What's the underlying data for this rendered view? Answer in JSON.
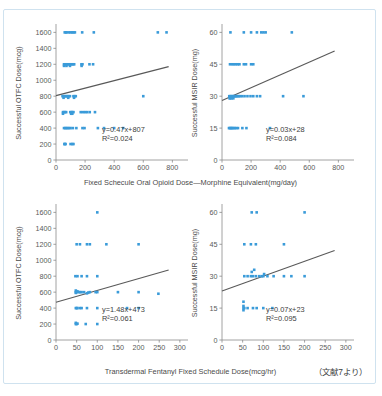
{
  "header": {
    "cropped_title_fragment": ""
  },
  "figure": {
    "source_note": "（文献7より）",
    "shared_xlabel_top": "Fixed Schecule Oral Opioid Dose—Morphine Equivalent(mg/day)",
    "shared_xlabel_bottom": "Transdermal Fentanyl Fixed Schedule Dose(mcg/hr)",
    "marker_color": "#3a9bd9",
    "trendline_color": "#595959",
    "axis_color": "#8a8a8a",
    "border_color": "#cfe2ef"
  },
  "chart_data": [
    {
      "id": "top-left",
      "type": "scatter",
      "title": "",
      "xlabel": "Fixed Schecule Oral Opioid Dose—Morphine Equivalent(mg/day)",
      "ylabel": "Successful OTFC Dose(mcg)",
      "xlim": [
        0,
        880
      ],
      "ylim": [
        0,
        1680
      ],
      "xticks": [
        0,
        200,
        400,
        600,
        800
      ],
      "yticks": [
        0,
        200,
        400,
        600,
        800,
        1000,
        1200,
        1400,
        1600
      ],
      "grid": false,
      "legend": "none",
      "fit_label": "y=0.47x+807",
      "r2_label": "R²=0.024",
      "fit_slope": 0.47,
      "fit_intercept": 807,
      "r2": 0.024,
      "points": [
        [
          60,
          1600
        ],
        [
          68,
          1600
        ],
        [
          75,
          1600
        ],
        [
          90,
          1600
        ],
        [
          100,
          1600
        ],
        [
          112,
          1600
        ],
        [
          120,
          1600
        ],
        [
          130,
          1600
        ],
        [
          180,
          1600
        ],
        [
          260,
          1600
        ],
        [
          700,
          1600
        ],
        [
          760,
          1600
        ],
        [
          55,
          1200
        ],
        [
          62,
          1200
        ],
        [
          70,
          1200
        ],
        [
          78,
          1200
        ],
        [
          86,
          1200
        ],
        [
          95,
          1200
        ],
        [
          100,
          1200
        ],
        [
          108,
          1200
        ],
        [
          118,
          1200
        ],
        [
          125,
          1200
        ],
        [
          175,
          1200
        ],
        [
          182,
          1200
        ],
        [
          230,
          1200
        ],
        [
          255,
          1200
        ],
        [
          55,
          1180
        ],
        [
          72,
          1180
        ],
        [
          96,
          1180
        ],
        [
          176,
          1180
        ],
        [
          45,
          800
        ],
        [
          52,
          800
        ],
        [
          60,
          800
        ],
        [
          66,
          800
        ],
        [
          74,
          800
        ],
        [
          80,
          800
        ],
        [
          88,
          800
        ],
        [
          96,
          800
        ],
        [
          120,
          800
        ],
        [
          128,
          800
        ],
        [
          136,
          800
        ],
        [
          600,
          800
        ],
        [
          52,
          780
        ],
        [
          84,
          780
        ],
        [
          124,
          780
        ],
        [
          48,
          600
        ],
        [
          55,
          600
        ],
        [
          62,
          600
        ],
        [
          70,
          600
        ],
        [
          98,
          600
        ],
        [
          106,
          600
        ],
        [
          112,
          600
        ],
        [
          120,
          600
        ],
        [
          170,
          600
        ],
        [
          186,
          600
        ],
        [
          200,
          600
        ],
        [
          214,
          600
        ],
        [
          232,
          600
        ],
        [
          268,
          600
        ],
        [
          48,
          580
        ],
        [
          104,
          580
        ],
        [
          112,
          580
        ],
        [
          55,
          400
        ],
        [
          64,
          400
        ],
        [
          72,
          400
        ],
        [
          80,
          400
        ],
        [
          90,
          400
        ],
        [
          100,
          400
        ],
        [
          116,
          400
        ],
        [
          140,
          400
        ],
        [
          182,
          400
        ],
        [
          196,
          400
        ],
        [
          288,
          400
        ],
        [
          330,
          400
        ],
        [
          400,
          400
        ],
        [
          462,
          400
        ],
        [
          58,
          200
        ],
        [
          60,
          200
        ],
        [
          66,
          200
        ],
        [
          100,
          200
        ],
        [
          112,
          200
        ],
        [
          120,
          200
        ]
      ]
    },
    {
      "id": "top-right",
      "type": "scatter",
      "title": "",
      "xlabel": "Fixed Schecule Oral Opioid Dose—Morphine Equivalent(mg/day)",
      "ylabel": "Successful MSIR Dose(mg)",
      "xlim": [
        0,
        880
      ],
      "ylim": [
        0,
        63
      ],
      "xticks": [
        0,
        200,
        400,
        600,
        800
      ],
      "yticks": [
        0,
        15,
        30,
        45,
        60
      ],
      "grid": false,
      "legend": "none",
      "fit_label": "y=0.03x+28",
      "r2_label": "R²=0.084",
      "fit_slope": 0.03,
      "fit_intercept": 28,
      "r2": 0.084,
      "points": [
        [
          58,
          60
        ],
        [
          150,
          60
        ],
        [
          200,
          60
        ],
        [
          240,
          60
        ],
        [
          270,
          60
        ],
        [
          285,
          60
        ],
        [
          300,
          60
        ],
        [
          480,
          60
        ],
        [
          55,
          45
        ],
        [
          70,
          45
        ],
        [
          82,
          45
        ],
        [
          95,
          45
        ],
        [
          108,
          45
        ],
        [
          120,
          45
        ],
        [
          150,
          45
        ],
        [
          165,
          45
        ],
        [
          200,
          45
        ],
        [
          215,
          45
        ],
        [
          50,
          30
        ],
        [
          56,
          30
        ],
        [
          62,
          30
        ],
        [
          68,
          30
        ],
        [
          74,
          30
        ],
        [
          80,
          30
        ],
        [
          86,
          30
        ],
        [
          92,
          30
        ],
        [
          98,
          30
        ],
        [
          106,
          30
        ],
        [
          114,
          30
        ],
        [
          124,
          30
        ],
        [
          138,
          30
        ],
        [
          155,
          30
        ],
        [
          175,
          30
        ],
        [
          196,
          30
        ],
        [
          215,
          30
        ],
        [
          240,
          30
        ],
        [
          262,
          30
        ],
        [
          420,
          30
        ],
        [
          560,
          30
        ],
        [
          52,
          29
        ],
        [
          58,
          29
        ],
        [
          66,
          29
        ],
        [
          78,
          29
        ],
        [
          48,
          15
        ],
        [
          54,
          15
        ],
        [
          60,
          15
        ],
        [
          66,
          15
        ],
        [
          72,
          15
        ],
        [
          80,
          15
        ],
        [
          88,
          15
        ],
        [
          98,
          15
        ],
        [
          110,
          15
        ],
        [
          140,
          15
        ],
        [
          168,
          15
        ],
        [
          330,
          15
        ]
      ]
    },
    {
      "id": "bottom-left",
      "type": "scatter",
      "title": "",
      "xlabel": "Transdermal Fentanyl Fixed Schedule Dose(mcg/hr)",
      "ylabel": "Successful OTFC Dose(mcg)",
      "xlim": [
        0,
        310
      ],
      "ylim": [
        0,
        1680
      ],
      "xticks": [
        0,
        50,
        100,
        150,
        200,
        250,
        300
      ],
      "yticks": [
        0,
        200,
        400,
        600,
        800,
        1000,
        1200,
        1400,
        1600
      ],
      "grid": false,
      "legend": "none",
      "fit_label": "y=1.48x+473",
      "r2_label": "R²=0.061",
      "fit_slope": 1.48,
      "fit_intercept": 473,
      "r2": 0.061,
      "points": [
        [
          100,
          1600
        ],
        [
          50,
          1200
        ],
        [
          58,
          1200
        ],
        [
          75,
          1200
        ],
        [
          82,
          1200
        ],
        [
          122,
          1200
        ],
        [
          200,
          1200
        ],
        [
          47,
          800
        ],
        [
          52,
          800
        ],
        [
          62,
          800
        ],
        [
          75,
          800
        ],
        [
          100,
          800
        ],
        [
          48,
          620
        ],
        [
          48,
          600
        ],
        [
          48,
          590
        ],
        [
          50,
          600
        ],
        [
          52,
          610
        ],
        [
          55,
          600
        ],
        [
          58,
          600
        ],
        [
          62,
          600
        ],
        [
          68,
          600
        ],
        [
          75,
          585
        ],
        [
          78,
          595
        ],
        [
          82,
          600
        ],
        [
          96,
          600
        ],
        [
          100,
          600
        ],
        [
          150,
          600
        ],
        [
          200,
          600
        ],
        [
          248,
          580
        ],
        [
          48,
          400
        ],
        [
          50,
          400
        ],
        [
          52,
          400
        ],
        [
          58,
          400
        ],
        [
          62,
          400
        ],
        [
          75,
          400
        ],
        [
          100,
          400
        ],
        [
          172,
          400
        ],
        [
          200,
          400
        ],
        [
          48,
          200
        ],
        [
          48,
          215
        ],
        [
          50,
          200
        ],
        [
          52,
          205
        ],
        [
          72,
          200
        ],
        [
          100,
          200
        ]
      ]
    },
    {
      "id": "bottom-right",
      "type": "scatter",
      "title": "",
      "xlabel": "Transdermal Fentanyl Fixed Schedule Dose(mcg/hr)",
      "ylabel": "Successful MSIR Dose(mg)",
      "xlim": [
        0,
        310
      ],
      "ylim": [
        0,
        63
      ],
      "xticks": [
        0,
        50,
        100,
        150,
        200,
        250,
        300
      ],
      "yticks": [
        0,
        15,
        30,
        45,
        60
      ],
      "grid": false,
      "legend": "none",
      "fit_label": "y=0.07x+23",
      "r2_label": "R²=0.095",
      "fit_slope": 0.07,
      "fit_intercept": 23,
      "r2": 0.095,
      "points": [
        [
          72,
          60
        ],
        [
          84,
          60
        ],
        [
          200,
          60
        ],
        [
          54,
          45
        ],
        [
          70,
          45
        ],
        [
          82,
          45
        ],
        [
          150,
          45
        ],
        [
          54,
          30
        ],
        [
          62,
          30
        ],
        [
          70,
          30
        ],
        [
          72,
          32
        ],
        [
          75,
          30
        ],
        [
          78,
          33
        ],
        [
          82,
          30
        ],
        [
          90,
          30
        ],
        [
          96,
          30
        ],
        [
          100,
          30
        ],
        [
          102,
          31
        ],
        [
          110,
          30
        ],
        [
          125,
          30
        ],
        [
          150,
          30
        ],
        [
          168,
          30
        ],
        [
          200,
          30
        ],
        [
          52,
          18
        ],
        [
          52,
          16
        ],
        [
          52,
          15
        ],
        [
          52,
          14
        ],
        [
          54,
          15
        ],
        [
          62,
          15
        ],
        [
          75,
          15
        ],
        [
          84,
          15
        ],
        [
          100,
          15
        ],
        [
          122,
          15
        ]
      ]
    }
  ]
}
